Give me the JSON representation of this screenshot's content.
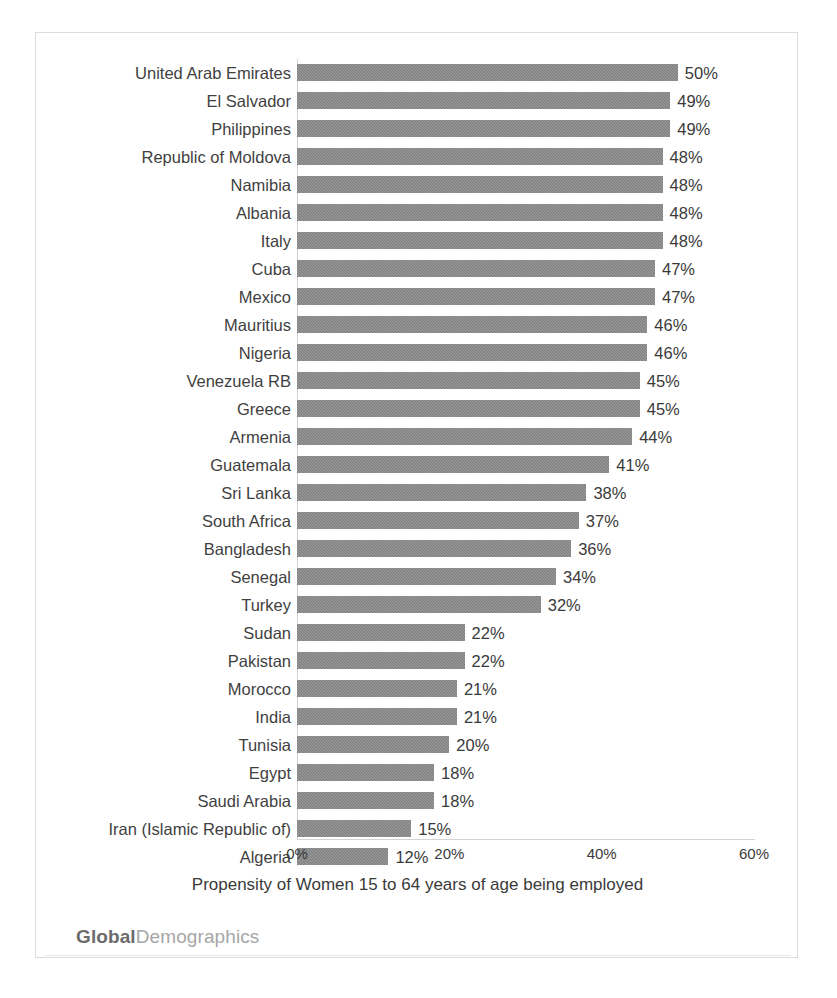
{
  "chart_data": {
    "type": "bar",
    "orientation": "horizontal",
    "title": "",
    "xlabel": "Propensity of Women 15 to 64 years of age  being employed",
    "ylabel": "",
    "xlim": [
      0,
      60
    ],
    "xticks": [
      "0%",
      "20%",
      "40%",
      "60%"
    ],
    "xtick_values": [
      0,
      20,
      40,
      60
    ],
    "grid": false,
    "legend": null,
    "bar_color": "#7b7b7b",
    "value_label_suffix": "%",
    "categories": [
      "United Arab Emirates",
      "El Salvador",
      "Philippines",
      "Republic of Moldova",
      "Namibia",
      "Albania",
      "Italy",
      "Cuba",
      "Mexico",
      "Mauritius",
      "Nigeria",
      "Venezuela RB",
      "Greece",
      "Armenia",
      "Guatemala",
      "Sri Lanka",
      "South Africa",
      "Bangladesh",
      "Senegal",
      "Turkey",
      "Sudan",
      "Pakistan",
      "Morocco",
      "India",
      "Tunisia",
      "Egypt",
      "Saudi Arabia",
      "Iran (Islamic Republic of)",
      "Algeria"
    ],
    "values": [
      50,
      49,
      49,
      48,
      48,
      48,
      48,
      47,
      47,
      46,
      46,
      45,
      45,
      44,
      41,
      38,
      37,
      36,
      34,
      32,
      22,
      22,
      21,
      21,
      20,
      18,
      18,
      15,
      12
    ],
    "value_labels": [
      "50%",
      "49%",
      "49%",
      "48%",
      "48%",
      "48%",
      "48%",
      "47%",
      "47%",
      "46%",
      "46%",
      "45%",
      "45%",
      "44%",
      "41%",
      "38%",
      "37%",
      "36%",
      "34%",
      "32%",
      "22%",
      "22%",
      "21%",
      "21%",
      "20%",
      "18%",
      "18%",
      "15%",
      "12%"
    ]
  },
  "footer": {
    "logo_bold": "Global",
    "logo_light": "Demographics"
  }
}
